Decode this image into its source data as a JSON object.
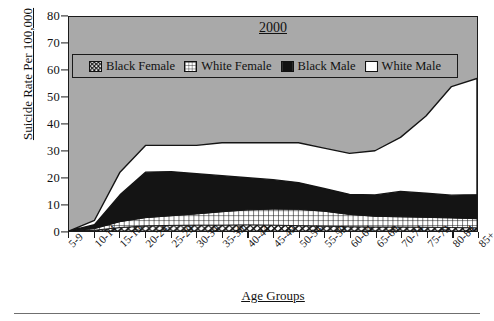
{
  "chart_title": "2000",
  "axes": {
    "ylabel": "Suicide Rate Per 100,000",
    "xlabel": "Age Groups",
    "yticks": [
      0,
      10,
      20,
      30,
      40,
      50,
      60,
      70,
      80
    ]
  },
  "legend": {
    "items": [
      {
        "label": "Black Female",
        "swatch": "diagonal-hatch-swatch",
        "color": "#ffffff"
      },
      {
        "label": "White Female",
        "swatch": "grid-hatch-swatch",
        "color": "#ffffff"
      },
      {
        "label": "Black Male",
        "swatch": "solid-black-swatch",
        "color": "#111111"
      },
      {
        "label": "White Male",
        "swatch": "solid-white-swatch",
        "color": "#ffffff"
      }
    ]
  },
  "chart_data": {
    "type": "area",
    "stacked": true,
    "title": "2000",
    "xlabel": "Age Groups",
    "ylabel": "Suicide Rate Per 100,000",
    "ylim": [
      0,
      80
    ],
    "grid": false,
    "legend_position": "inside-top-left",
    "plot_background": "#a9a9a9",
    "categories": [
      "5-9",
      "10-14",
      "15-19",
      "20-24",
      "25-29",
      "30-34",
      "35-39",
      "40-44",
      "45-49",
      "50-54",
      "55-59",
      "60-64",
      "65-69",
      "70-74",
      "75-79",
      "80-84",
      "85+"
    ],
    "series": [
      {
        "name": "Black Female",
        "values": [
          0.0,
          0.3,
          1.3,
          1.9,
          2.1,
          2.2,
          2.2,
          2.3,
          2.2,
          2.0,
          1.8,
          1.6,
          1.5,
          1.5,
          1.4,
          1.3,
          1.2
        ]
      },
      {
        "name": "White Female",
        "values": [
          0.0,
          0.6,
          2.2,
          3.1,
          3.6,
          4.2,
          5.0,
          5.6,
          6.0,
          6.1,
          5.6,
          4.6,
          4.0,
          3.8,
          3.7,
          3.6,
          3.4
        ]
      },
      {
        "name": "Black Male",
        "values": [
          0.0,
          1.5,
          10.0,
          17.0,
          16.5,
          15.0,
          13.5,
          12.0,
          11.0,
          10.0,
          8.5,
          7.5,
          8.0,
          9.5,
          9.0,
          8.5,
          9.0
        ]
      },
      {
        "name": "White Male",
        "values": [
          0.0,
          1.6,
          8.5,
          10.0,
          9.8,
          10.6,
          12.3,
          13.1,
          13.8,
          14.9,
          15.1,
          15.3,
          16.5,
          20.2,
          28.9,
          40.6,
          43.4
        ]
      }
    ],
    "series_totals": [
      0.0,
      4.0,
      22.0,
      32.0,
      32.0,
      32.0,
      33.0,
      33.0,
      33.0,
      33.0,
      31.0,
      29.0,
      30.0,
      35.0,
      43.0,
      54.0,
      57.0
    ]
  }
}
